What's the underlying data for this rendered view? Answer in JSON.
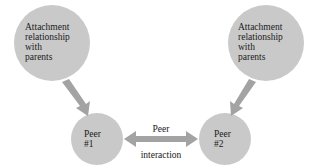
{
  "diagram": {
    "colors": {
      "circle_fill": "#c9c9c9",
      "arrow_fill": "#a3a3a3",
      "text": "#1a1a1a",
      "background": "#ffffff"
    },
    "nodes": [
      {
        "id": "parents-left",
        "lines": [
          "Attachment",
          "relationship",
          "with",
          "parents"
        ]
      },
      {
        "id": "parents-right",
        "lines": [
          "Attachment",
          "relationship",
          "with",
          "parents"
        ]
      },
      {
        "id": "peer-1",
        "lines": [
          "Peer",
          "#1"
        ]
      },
      {
        "id": "peer-2",
        "lines": [
          "Peer",
          "#2"
        ]
      }
    ],
    "edges": [
      {
        "from": "parents-left",
        "to": "peer-1",
        "type": "one-way"
      },
      {
        "from": "parents-right",
        "to": "peer-2",
        "type": "one-way"
      },
      {
        "from": "peer-1",
        "to": "peer-2",
        "type": "two-way",
        "label_top": "Peer",
        "label_bottom": "interaction"
      }
    ]
  }
}
